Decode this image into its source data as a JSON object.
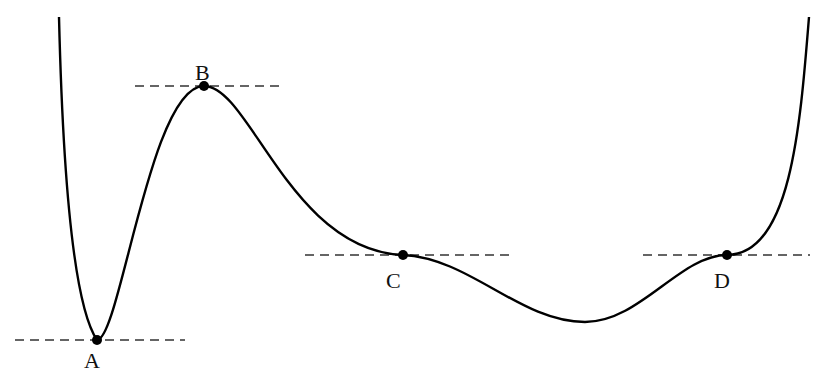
{
  "diagram": {
    "type": "potential-energy-curve",
    "colors": {
      "curve": "#000000",
      "tangent": "#333333",
      "point": "#000000",
      "label": "#111111"
    },
    "points": [
      {
        "id": "A",
        "label": "A",
        "kind": "minimum",
        "x": 97,
        "y": 340,
        "label_x": 84,
        "label_y": 350,
        "tangent_x1": 15,
        "tangent_x2": 185
      },
      {
        "id": "B",
        "label": "B",
        "kind": "maximum",
        "x": 204,
        "y": 86,
        "label_x": 195,
        "label_y": 62,
        "tangent_x1": 135,
        "tangent_x2": 280
      },
      {
        "id": "C",
        "label": "C",
        "kind": "inflection",
        "x": 403,
        "y": 255,
        "label_x": 386,
        "label_y": 270,
        "tangent_x1": 305,
        "tangent_x2": 510
      },
      {
        "id": "D",
        "label": "D",
        "kind": "inflection",
        "x": 727,
        "y": 255,
        "label_x": 714,
        "label_y": 270,
        "tangent_x1": 643,
        "tangent_x2": 810
      }
    ],
    "unlabeled_minimum": {
      "x": 585,
      "y": 322
    }
  }
}
